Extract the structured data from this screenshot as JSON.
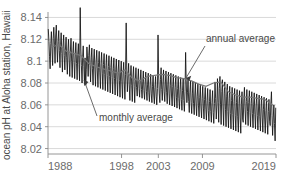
{
  "chart_data": {
    "type": "line",
    "title": "",
    "xlabel": "",
    "ylabel": "ocean pH at Aloha station, Hawaii",
    "xlim": [
      1988,
      2019
    ],
    "ylim": [
      8.015,
      8.145
    ],
    "grid": true,
    "legend_position": "inline-annotations",
    "x_ticks": [
      1988,
      1998,
      2003,
      2009,
      2019
    ],
    "x_tick_labels": [
      "1988",
      "1998",
      "2003",
      "2009",
      "2019"
    ],
    "y_ticks": [
      8.02,
      8.04,
      8.06,
      8.08,
      8.1,
      8.12,
      8.14
    ],
    "y_tick_labels": [
      "8.02",
      "8.04",
      "8.06",
      "8.08",
      "8.1",
      "8.12",
      "8.14"
    ],
    "annotations": [
      {
        "text": "annual average",
        "x": 2010.5,
        "y": 8.128
      },
      {
        "text": "monthly average",
        "x": 1995.0,
        "y": 8.042
      }
    ],
    "series": [
      {
        "name": "monthly average",
        "color": "#111111",
        "x": [
          1988.04,
          1988.13,
          1988.21,
          1988.29,
          1988.38,
          1988.46,
          1988.54,
          1988.63,
          1988.71,
          1988.79,
          1988.88,
          1988.96,
          1989.04,
          1989.13,
          1989.21,
          1989.29,
          1989.38,
          1989.46,
          1989.54,
          1989.63,
          1989.71,
          1989.79,
          1989.88,
          1989.96,
          1990.04,
          1990.13,
          1990.21,
          1990.29,
          1990.38,
          1990.46,
          1990.54,
          1990.63,
          1990.71,
          1990.79,
          1990.88,
          1990.96,
          1991.04,
          1991.13,
          1991.21,
          1991.29,
          1991.38,
          1991.46,
          1991.54,
          1991.63,
          1991.71,
          1991.79,
          1991.88,
          1991.96,
          1992.04,
          1992.13,
          1992.21,
          1992.29,
          1992.38,
          1992.46,
          1992.54,
          1992.63,
          1992.71,
          1992.79,
          1992.88,
          1992.96,
          1993.04,
          1993.13,
          1993.21,
          1993.29,
          1993.38,
          1993.46,
          1993.54,
          1993.63,
          1993.71,
          1993.79,
          1993.88,
          1993.96,
          1994.04,
          1994.13,
          1994.21,
          1994.29,
          1994.38,
          1994.46,
          1994.54,
          1994.63,
          1994.71,
          1994.79,
          1994.88,
          1994.96,
          1995.04,
          1995.13,
          1995.21,
          1995.29,
          1995.38,
          1995.46,
          1995.54,
          1995.63,
          1995.71,
          1995.79,
          1995.88,
          1995.96,
          1996.04,
          1996.13,
          1996.21,
          1996.29,
          1996.38,
          1996.46,
          1996.54,
          1996.63,
          1996.71,
          1996.79,
          1996.88,
          1996.96,
          1997.04,
          1997.13,
          1997.21,
          1997.29,
          1997.38,
          1997.46,
          1997.54,
          1997.63,
          1997.71,
          1997.79,
          1997.88,
          1997.96,
          1998.04,
          1998.13,
          1998.21,
          1998.29,
          1998.38,
          1998.46,
          1998.54,
          1998.63,
          1998.71,
          1998.79,
          1998.88,
          1998.96,
          1999.04,
          1999.13,
          1999.21,
          1999.29,
          1999.38,
          1999.46,
          1999.54,
          1999.63,
          1999.71,
          1999.79,
          1999.88,
          1999.96,
          2000.04,
          2000.13,
          2000.21,
          2000.29,
          2000.38,
          2000.46,
          2000.54,
          2000.63,
          2000.71,
          2000.79,
          2000.88,
          2000.96,
          2001.04,
          2001.13,
          2001.21,
          2001.29,
          2001.38,
          2001.46,
          2001.54,
          2001.63,
          2001.71,
          2001.79,
          2001.88,
          2001.96,
          2002.04,
          2002.13,
          2002.21,
          2002.29,
          2002.38,
          2002.46,
          2002.54,
          2002.63,
          2002.71,
          2002.79,
          2002.88,
          2002.96,
          2003.04,
          2003.13,
          2003.21,
          2003.29,
          2003.38,
          2003.46,
          2003.54,
          2003.63,
          2003.71,
          2003.79,
          2003.88,
          2003.96,
          2004.04,
          2004.13,
          2004.21,
          2004.29,
          2004.38,
          2004.46,
          2004.54,
          2004.63,
          2004.71,
          2004.79,
          2004.88,
          2004.96,
          2005.04,
          2005.13,
          2005.21,
          2005.29,
          2005.38,
          2005.46,
          2005.54,
          2005.63,
          2005.71,
          2005.79,
          2005.88,
          2005.96,
          2006.04,
          2006.13,
          2006.21,
          2006.29,
          2006.38,
          2006.46,
          2006.54,
          2006.63,
          2006.71,
          2006.79,
          2006.88,
          2006.96,
          2007.04,
          2007.13,
          2007.21,
          2007.29,
          2007.38,
          2007.46,
          2007.54,
          2007.63,
          2007.71,
          2007.79,
          2007.88,
          2007.96,
          2008.04,
          2008.13,
          2008.21,
          2008.29,
          2008.38,
          2008.46,
          2008.54,
          2008.63,
          2008.71,
          2008.79,
          2008.88,
          2008.96,
          2009.04,
          2009.13,
          2009.21,
          2009.29,
          2009.38,
          2009.46,
          2009.54,
          2009.63,
          2009.71,
          2009.79,
          2009.88,
          2009.96,
          2010.04,
          2010.13,
          2010.21,
          2010.29,
          2010.38,
          2010.46,
          2010.54,
          2010.63,
          2010.71,
          2010.79,
          2010.88,
          2010.96,
          2011.04,
          2011.13,
          2011.21,
          2011.29,
          2011.38,
          2011.46,
          2011.54,
          2011.63,
          2011.71,
          2011.79,
          2011.88,
          2011.96,
          2012.04,
          2012.13,
          2012.21,
          2012.29,
          2012.38,
          2012.46,
          2012.54,
          2012.63,
          2012.71,
          2012.79,
          2012.88,
          2012.96,
          2013.04,
          2013.13,
          2013.21,
          2013.29,
          2013.38,
          2013.46,
          2013.54,
          2013.63,
          2013.71,
          2013.79,
          2013.88,
          2013.96,
          2014.04,
          2014.13,
          2014.21,
          2014.29,
          2014.38,
          2014.46,
          2014.54,
          2014.63,
          2014.71,
          2014.79,
          2014.88,
          2014.96,
          2015.04,
          2015.13,
          2015.21,
          2015.29,
          2015.38,
          2015.46,
          2015.54,
          2015.63,
          2015.71,
          2015.79,
          2015.88,
          2015.96,
          2016.04,
          2016.13,
          2016.21,
          2016.29,
          2016.38,
          2016.46,
          2016.54,
          2016.63,
          2016.71,
          2016.79,
          2016.88,
          2016.96,
          2017.04,
          2017.13,
          2017.21,
          2017.29,
          2017.38,
          2017.46,
          2017.54,
          2017.63,
          2017.71,
          2017.79,
          2017.88,
          2017.96,
          2018.04,
          2018.13,
          2018.21,
          2018.29,
          2018.38,
          2018.46,
          2018.54,
          2018.63,
          2018.71,
          2018.79,
          2018.88,
          2018.96
        ],
        "y": [
          8.129,
          8.118,
          8.104,
          8.093,
          8.116,
          8.127,
          8.112,
          8.096,
          8.121,
          8.131,
          8.115,
          8.098,
          8.123,
          8.133,
          8.114,
          8.099,
          8.118,
          8.128,
          8.11,
          8.094,
          8.115,
          8.126,
          8.107,
          8.09,
          8.113,
          8.124,
          8.105,
          8.092,
          8.112,
          8.122,
          8.103,
          8.088,
          8.11,
          8.12,
          8.101,
          8.086,
          8.109,
          8.121,
          8.1,
          8.085,
          8.108,
          8.118,
          8.099,
          8.084,
          8.107,
          8.117,
          8.098,
          8.083,
          8.106,
          8.116,
          8.097,
          8.082,
          8.149,
          8.112,
          8.096,
          8.08,
          8.104,
          8.114,
          8.095,
          8.079,
          8.103,
          8.078,
          8.092,
          8.113,
          8.102,
          8.086,
          8.105,
          8.115,
          8.096,
          8.081,
          8.103,
          8.112,
          8.093,
          8.078,
          8.101,
          8.111,
          8.092,
          8.077,
          8.1,
          8.11,
          8.091,
          8.076,
          8.099,
          8.109,
          8.09,
          8.075,
          8.098,
          8.108,
          8.089,
          8.074,
          8.097,
          8.107,
          8.088,
          8.073,
          8.096,
          8.106,
          8.087,
          8.072,
          8.095,
          8.105,
          8.086,
          8.071,
          8.094,
          8.104,
          8.085,
          8.07,
          8.093,
          8.103,
          8.084,
          8.069,
          8.092,
          8.102,
          8.083,
          8.068,
          8.091,
          8.101,
          8.082,
          8.067,
          8.09,
          8.1,
          8.081,
          8.066,
          8.089,
          8.099,
          8.08,
          8.065,
          8.088,
          8.135,
          8.09,
          8.072,
          8.087,
          8.098,
          8.079,
          8.064,
          8.086,
          8.096,
          8.078,
          8.063,
          8.085,
          8.095,
          8.077,
          8.062,
          8.084,
          8.094,
          8.076,
          8.068,
          8.083,
          8.093,
          8.075,
          8.067,
          8.082,
          8.092,
          8.074,
          8.066,
          8.081,
          8.091,
          8.073,
          8.065,
          8.08,
          8.09,
          8.072,
          8.064,
          8.079,
          8.089,
          8.071,
          8.063,
          8.078,
          8.088,
          8.07,
          8.062,
          8.077,
          8.087,
          8.069,
          8.061,
          8.076,
          8.086,
          8.068,
          8.06,
          8.075,
          8.124,
          8.088,
          8.07,
          8.062,
          8.083,
          8.094,
          8.074,
          8.064,
          8.081,
          8.092,
          8.072,
          8.063,
          8.08,
          8.091,
          8.071,
          8.061,
          8.079,
          8.09,
          8.07,
          8.06,
          8.078,
          8.089,
          8.069,
          8.059,
          8.077,
          8.088,
          8.068,
          8.058,
          8.076,
          8.087,
          8.067,
          8.057,
          8.075,
          8.086,
          8.066,
          8.056,
          8.074,
          8.085,
          8.065,
          8.055,
          8.073,
          8.084,
          8.064,
          8.054,
          8.072,
          8.108,
          8.082,
          8.062,
          8.071,
          8.083,
          8.063,
          8.053,
          8.071,
          8.082,
          8.062,
          8.052,
          8.07,
          8.081,
          8.061,
          8.051,
          8.069,
          8.08,
          8.06,
          8.05,
          8.068,
          8.079,
          8.059,
          8.049,
          8.067,
          8.078,
          8.058,
          8.048,
          8.066,
          8.077,
          8.057,
          8.047,
          8.065,
          8.076,
          8.056,
          8.046,
          8.064,
          8.075,
          8.055,
          8.045,
          8.063,
          8.074,
          8.054,
          8.044,
          8.062,
          8.073,
          8.053,
          8.043,
          8.061,
          8.081,
          8.066,
          8.047,
          8.06,
          8.084,
          8.062,
          8.044,
          8.075,
          8.086,
          8.06,
          8.042,
          8.072,
          8.083,
          8.058,
          8.041,
          8.07,
          8.081,
          8.056,
          8.04,
          8.068,
          8.079,
          8.054,
          8.039,
          8.066,
          8.077,
          8.052,
          8.038,
          8.064,
          8.076,
          8.051,
          8.037,
          8.063,
          8.075,
          8.05,
          8.036,
          8.062,
          8.074,
          8.049,
          8.035,
          8.061,
          8.073,
          8.048,
          8.034,
          8.06,
          8.072,
          8.047,
          8.044,
          8.066,
          8.076,
          8.056,
          8.042,
          8.063,
          8.074,
          8.054,
          8.041,
          8.062,
          8.073,
          8.053,
          8.04,
          8.061,
          8.072,
          8.052,
          8.039,
          8.06,
          8.071,
          8.051,
          8.038,
          8.059,
          8.07,
          8.05,
          8.037,
          8.058,
          8.069,
          8.049,
          8.036,
          8.057,
          8.068,
          8.048,
          8.035,
          8.056,
          8.067,
          8.047,
          8.034,
          8.055,
          8.066,
          8.046,
          8.033,
          8.054,
          8.065,
          8.045,
          8.041,
          8.06,
          8.072,
          8.05,
          8.032,
          8.048,
          8.06,
          8.043,
          8.027,
          8.057
        ]
      },
      {
        "name": "annual average",
        "color": "#777777",
        "x": [
          1988.5,
          1989.5,
          1990.5,
          1991.5,
          1992.5,
          1993.5,
          1994.5,
          1995.5,
          1996.5,
          1997.5,
          1998.5,
          1999.5,
          2000.5,
          2001.5,
          2002.5,
          2003.5,
          2004.5,
          2005.5,
          2006.5,
          2007.5,
          2008.5,
          2009.5,
          2010.5,
          2011.5,
          2012.5,
          2013.5,
          2014.5,
          2015.5,
          2016.5,
          2017.5,
          2018.5
        ],
        "y": [
          8.113,
          8.115,
          8.109,
          8.107,
          8.105,
          8.098,
          8.095,
          8.093,
          8.091,
          8.089,
          8.092,
          8.084,
          8.082,
          8.086,
          8.087,
          8.088,
          8.087,
          8.085,
          8.084,
          8.082,
          8.079,
          8.077,
          8.08,
          8.081,
          8.072,
          8.069,
          8.067,
          8.067,
          8.066,
          8.065,
          8.06
        ]
      }
    ]
  }
}
